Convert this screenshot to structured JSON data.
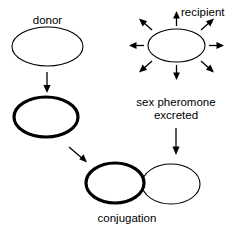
{
  "diagram": {
    "background_color": "#ffffff",
    "stroke_color": "#000000",
    "labels": {
      "donor": "donor",
      "recipient": "recipient",
      "pheromone_line1": "sex pheromone",
      "pheromone_line2": "excreted",
      "conjugation": "conjugation"
    },
    "cells": [
      {
        "name": "donor-cell-initial",
        "label": "donor",
        "outline": "thin",
        "cx": 47.5,
        "cy": 46.5,
        "rx": 35.5,
        "ry": 19.5
      },
      {
        "name": "donor-cell-activated",
        "label": "",
        "outline": "thick",
        "cx": 46,
        "cy": 117,
        "rx": 32,
        "ry": 20
      },
      {
        "name": "recipient-cell",
        "label": "recipient",
        "outline": "thin",
        "cx": 176.5,
        "cy": 45.5,
        "rx": 28.5,
        "ry": 16.5
      },
      {
        "name": "conjugation-donor-cell",
        "label": "",
        "outline": "thick",
        "cx": 115,
        "cy": 183,
        "rx": 29,
        "ry": 20
      },
      {
        "name": "conjugation-recipient-cell",
        "label": "",
        "outline": "thin",
        "cx": 171,
        "cy": 184,
        "rx": 29,
        "ry": 20
      }
    ],
    "pheromone_arrow_count": 8,
    "flow_arrows": [
      {
        "name": "donor-maturation-arrow",
        "direction": "down"
      },
      {
        "name": "pheromone-excretion-arrow",
        "direction": "down"
      },
      {
        "name": "conjugation-approach-arrow",
        "direction": "diagonal-down-right"
      }
    ]
  }
}
